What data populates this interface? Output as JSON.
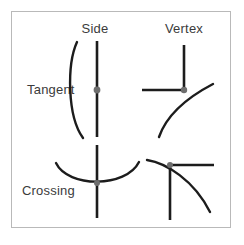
{
  "figure": {
    "title": "",
    "frame": {
      "border_color": "#b9b9b9",
      "background": "#ffffff"
    },
    "column_headers": [
      {
        "id": "side",
        "label": "Side"
      },
      {
        "id": "vertex",
        "label": "Vertex"
      }
    ],
    "row_headers": [
      {
        "id": "tangent",
        "label": "Tangent"
      },
      {
        "id": "crossing",
        "label": "Crossing"
      }
    ],
    "colors": {
      "stroke": "#1c1c1c",
      "dot": "#6e6e6e",
      "text": "#3b3b3b",
      "border": "#b9b9b9"
    },
    "cells": [
      {
        "id": "tangent-side",
        "row": "Tangent",
        "column": "Side",
        "description": "A straight vertical line touched tangentially from the left by a curve; contact marked with a gray dot.",
        "contact_dot": true,
        "contact_type": "tangent",
        "feature_type": "side"
      },
      {
        "id": "tangent-vertex",
        "row": "Tangent",
        "column": "Vertex",
        "description": "An L-shaped corner formed by a vertical line going up and a horizontal line going left; a curve is tangent at the vertex.",
        "contact_dot": true,
        "contact_type": "tangent",
        "feature_type": "vertex"
      },
      {
        "id": "crossing-side",
        "row": "Crossing",
        "column": "Side",
        "description": "A straight vertical line crossed at the minimum of an upward-opening U curve.",
        "contact_dot": true,
        "contact_type": "crossing",
        "feature_type": "side"
      },
      {
        "id": "crossing-vertex",
        "row": "Crossing",
        "column": "Vertex",
        "description": "A corner formed by a vertical line going down and a horizontal line going right; a curve crosses through the vertex.",
        "contact_dot": true,
        "contact_type": "crossing",
        "feature_type": "vertex"
      }
    ]
  }
}
